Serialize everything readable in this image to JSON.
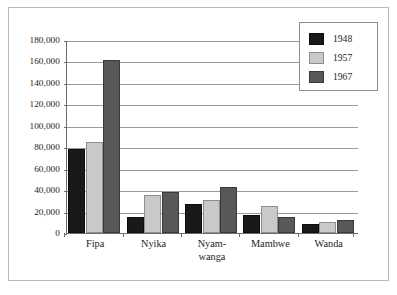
{
  "chart_data": {
    "type": "bar",
    "title": "",
    "subtitle": "",
    "xlabel": "",
    "ylabel": "",
    "categories": [
      "Fipa",
      "Nyika",
      "Nyam-\nwanga",
      "Mambwe",
      "Wanda"
    ],
    "series": [
      {
        "name": "1948",
        "color": "#191919",
        "values": [
          78000,
          15000,
          27000,
          17000,
          8000
        ]
      },
      {
        "name": "1957",
        "color": "#c9c9c9",
        "values": [
          85000,
          35000,
          31000,
          25000,
          10000
        ]
      },
      {
        "name": "1967",
        "color": "#585858",
        "values": [
          161000,
          38000,
          43000,
          15000,
          12000
        ]
      }
    ],
    "ylim": [
      0,
      180000
    ],
    "ytick_values": [
      0,
      20000,
      40000,
      60000,
      80000,
      100000,
      120000,
      140000,
      160000,
      180000
    ],
    "ytick_labels": [
      "0",
      "20,000",
      "40,000",
      "60,000",
      "80,000",
      "100,000",
      "120,000",
      "140,000",
      "160,000",
      "180,000"
    ],
    "grid": true,
    "grid_axis": "y",
    "legend_position": "top-right",
    "legend_entries": [
      "1948",
      "1957",
      "1967"
    ]
  },
  "figure": {
    "background_color": "#ffffff",
    "frame_color": "#b9b9b9",
    "axis_color": "#6d6d6d",
    "gridline_color": "#9a9a9a"
  }
}
